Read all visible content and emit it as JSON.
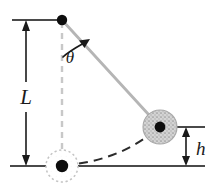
{
  "figure": {
    "type": "physics-diagram",
    "width": 216,
    "height": 187,
    "background_color": "#ffffff"
  },
  "labels": {
    "length": "L",
    "height": "h",
    "angle": "θ"
  },
  "colors": {
    "ink": "#1a1a1a",
    "rod": "#b5b5b5",
    "dashed_vertical": "#c8c8c8",
    "bob_fill": "#c9c9c9",
    "bob_edge": "#a8a8a8",
    "ghost_edge": "#c0c0c0",
    "arc_path": "#2b2b2b",
    "baseline": "#4a4a4a"
  },
  "geometry": {
    "pivot": {
      "x": 62,
      "y": 20,
      "radius": 5.2
    },
    "bob_raised": {
      "x": 160,
      "y": 127,
      "radius": 17,
      "dot_radius": 5.4
    },
    "bob_lowest": {
      "x": 62,
      "y": 166,
      "radius": 16,
      "dot_radius": 6.2
    },
    "rod": {
      "x1": 62,
      "y1": 20,
      "x2": 160,
      "y2": 127,
      "width": 2.6
    },
    "vertical_dashed": {
      "x": 62,
      "y1": 20,
      "y2": 166
    },
    "top_reference_line": {
      "x1": 12,
      "x2": 62,
      "y": 20
    },
    "baseline": {
      "x1": 10,
      "x2": 205,
      "y": 166
    },
    "length_arrow": {
      "x": 26,
      "y_top": 21,
      "y_bottom": 165
    },
    "height_arrow": {
      "x": 186,
      "y_top": 128,
      "y_bottom": 165
    },
    "height_tick_top": {
      "x1": 172,
      "x2": 205,
      "y": 127
    },
    "angle_arc": {
      "center_x": 62,
      "center_y": 20,
      "radius": 40
    }
  },
  "annotations": {
    "length_label_position": {
      "x": 20,
      "y": 102
    },
    "height_label_position": {
      "x": 195,
      "y": 155
    },
    "angle_label_position": {
      "x": 70,
      "y": 62
    }
  }
}
